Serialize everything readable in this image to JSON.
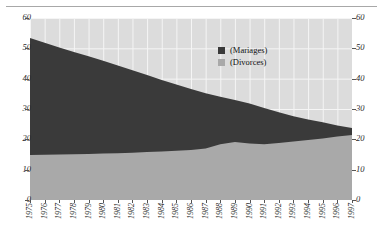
{
  "header": {
    "rule_only": true
  },
  "legend": {
    "items": [
      {
        "label": "(Mariages)",
        "color": "#3a3a3a"
      },
      {
        "label": "(Divorces)",
        "color": "#a9a9a9"
      }
    ]
  },
  "axes": {
    "y_ticks": [
      "0",
      "10",
      "20",
      "30",
      "40",
      "50",
      "60"
    ],
    "y_ticks_right": [
      "0",
      "10",
      "20",
      "30",
      "40",
      "50",
      "60"
    ]
  },
  "chart_data": {
    "type": "area",
    "title": "",
    "subtitle": "",
    "xlabel": "",
    "ylabel": "",
    "ylim": [
      0,
      60
    ],
    "ytick_step": 10,
    "grid": true,
    "legend_position": "inside-top-right",
    "stacked": false,
    "categories": [
      "1975",
      "1976",
      "1977",
      "1978",
      "1979",
      "1980",
      "1981",
      "1982",
      "1983",
      "1984",
      "1985",
      "1986",
      "1987",
      "1988",
      "1989",
      "1990",
      "1991",
      "1992",
      "1993",
      "1994",
      "1995",
      "1996",
      "1997"
    ],
    "series": [
      {
        "name": "(Mariages)",
        "color": "#3a3a3a",
        "values": [
          53.4,
          51.8,
          50.3,
          48.8,
          47.4,
          45.9,
          44.3,
          42.8,
          41.2,
          39.6,
          38.1,
          36.6,
          35.2,
          34.0,
          33.0,
          31.8,
          30.3,
          28.9,
          27.6,
          26.5,
          25.6,
          24.6,
          23.7
        ]
      },
      {
        "name": "(Divorces)",
        "color": "#a9a9a9",
        "values": [
          14.8,
          14.9,
          15.0,
          15.1,
          15.2,
          15.3,
          15.4,
          15.6,
          15.8,
          16.0,
          16.2,
          16.5,
          17.0,
          18.4,
          19.1,
          18.6,
          18.4,
          18.8,
          19.3,
          19.8,
          20.3,
          20.9,
          21.4
        ]
      }
    ]
  }
}
